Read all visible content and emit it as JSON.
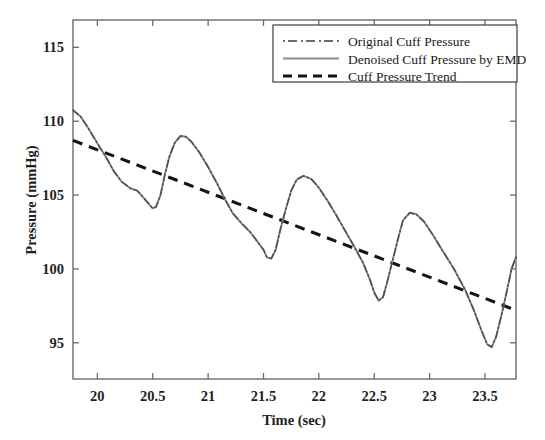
{
  "figure": {
    "background": "#ffffff",
    "plot_box": {
      "left": 73,
      "top": 20,
      "right": 516,
      "bottom": 379
    }
  },
  "chart_data": {
    "type": "line",
    "title": "",
    "xlabel": "Time (sec)",
    "ylabel": "Pressure (mmHg)",
    "xlim": [
      19.78,
      23.78
    ],
    "ylim": [
      92.55,
      116.85
    ],
    "xticks": [
      20,
      20.5,
      21,
      21.5,
      22,
      22.5,
      23,
      23.5
    ],
    "xticklabels": [
      "20",
      "20.5",
      "21",
      "21.5",
      "22",
      "22.5",
      "23",
      "23.5"
    ],
    "yticks": [
      95,
      100,
      105,
      110,
      115
    ],
    "yticklabels": [
      "95",
      "100",
      "105",
      "110",
      "115"
    ],
    "grid": false,
    "legend_position": "upper right",
    "colors": {
      "original": "#4d4d4d",
      "denoised": "#8a8a8a",
      "trend": "#141414",
      "axis": "#6b6b6b"
    },
    "series": [
      {
        "name": "Original Cuff Pressure",
        "style": "dash-dot",
        "color": "#4d4d4d",
        "note": "overlaps the denoised trace almost exactly"
      },
      {
        "name": "Denoised Cuff Pressure by EMD",
        "style": "solid",
        "color": "#8a8a8a",
        "x": [
          19.78,
          19.85,
          19.92,
          20.0,
          20.08,
          20.15,
          20.22,
          20.3,
          20.36,
          20.42,
          20.47,
          20.5,
          20.53,
          20.57,
          20.61,
          20.65,
          20.7,
          20.75,
          20.8,
          20.85,
          20.92,
          21.0,
          21.08,
          21.15,
          21.22,
          21.3,
          21.38,
          21.44,
          21.5,
          21.53,
          21.57,
          21.61,
          21.65,
          21.7,
          21.75,
          21.8,
          21.86,
          21.93,
          22.0,
          22.08,
          22.16,
          22.24,
          22.32,
          22.4,
          22.46,
          22.5,
          22.54,
          22.58,
          22.62,
          22.67,
          22.72,
          22.76,
          22.82,
          22.88,
          22.95,
          23.03,
          23.12,
          23.22,
          23.32,
          23.4,
          23.47,
          23.52,
          23.56,
          23.6,
          23.65,
          23.7,
          23.74,
          23.78
        ],
        "y": [
          110.75,
          110.3,
          109.5,
          108.5,
          107.55,
          106.6,
          105.9,
          105.45,
          105.3,
          104.8,
          104.35,
          104.1,
          104.2,
          105.0,
          106.4,
          107.6,
          108.55,
          109.0,
          108.95,
          108.6,
          107.9,
          106.9,
          105.8,
          104.75,
          103.8,
          103.1,
          102.5,
          101.9,
          101.3,
          100.8,
          100.7,
          101.3,
          102.6,
          104.0,
          105.3,
          106.05,
          106.3,
          106.1,
          105.5,
          104.6,
          103.6,
          102.55,
          101.5,
          100.4,
          99.3,
          98.4,
          97.85,
          98.1,
          99.2,
          100.7,
          102.2,
          103.3,
          103.8,
          103.7,
          103.2,
          102.3,
          101.2,
          100.0,
          98.6,
          97.2,
          95.8,
          94.9,
          94.7,
          95.4,
          96.9,
          98.6,
          100.0,
          100.8
        ]
      },
      {
        "name": "Cuff Pressure Trend",
        "style": "dashed",
        "color": "#141414",
        "x": [
          19.78,
          23.78
        ],
        "y": [
          108.7,
          97.2
        ]
      }
    ],
    "legend": [
      {
        "label": "Original Cuff Pressure",
        "style": "dash-dot",
        "color": "#4d4d4d"
      },
      {
        "label": "Denoised Cuff Pressure by EMD",
        "style": "solid",
        "color": "#8a8a8a"
      },
      {
        "label": "Cuff Pressure Trend",
        "style": "dashed",
        "color": "#141414"
      }
    ]
  }
}
